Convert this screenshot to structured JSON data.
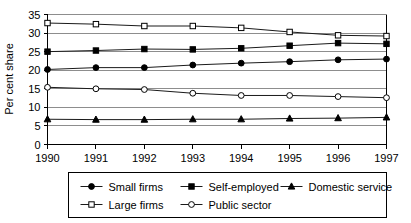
{
  "chart_data": {
    "type": "line",
    "title": "",
    "xlabel": "",
    "ylabel": "Per cent share",
    "categories": [
      "1990",
      "1991",
      "1992",
      "1993",
      "1994",
      "1995",
      "1996",
      "1997"
    ],
    "x": [
      1990,
      1991,
      1992,
      1993,
      1994,
      1995,
      1996,
      1997
    ],
    "ylim": [
      0,
      35
    ],
    "yticks": [
      0,
      5,
      10,
      15,
      20,
      25,
      30,
      35
    ],
    "ytick_labels": [
      "0",
      "5",
      "10",
      "15",
      "20",
      "25",
      "30",
      "35"
    ],
    "grid": true,
    "grid_axis": "y",
    "legend_position": "bottom",
    "series": [
      {
        "name": "Small firms",
        "marker": "filled-circle",
        "values": [
          20.2,
          20.7,
          20.7,
          21.4,
          21.9,
          22.3,
          22.8,
          23.0
        ]
      },
      {
        "name": "Self-employed",
        "marker": "filled-square",
        "values": [
          25.0,
          25.3,
          25.7,
          25.6,
          25.9,
          26.6,
          27.3,
          27.1
        ]
      },
      {
        "name": "Domestic service",
        "marker": "filled-triangle",
        "values": [
          6.8,
          6.7,
          6.7,
          6.8,
          6.8,
          7.0,
          7.1,
          7.3
        ]
      },
      {
        "name": "Large firms",
        "marker": "open-square",
        "values": [
          32.7,
          32.4,
          31.9,
          31.9,
          31.4,
          30.3,
          29.4,
          29.2
        ]
      },
      {
        "name": "Public sector",
        "marker": "open-circle",
        "values": [
          15.4,
          15.0,
          14.8,
          13.8,
          13.2,
          13.2,
          12.9,
          12.6
        ]
      }
    ]
  },
  "legend": {
    "rows": [
      [
        "Small firms",
        "Self-employed",
        "Domestic service"
      ],
      [
        "Large firms",
        "Public sector"
      ]
    ]
  },
  "axes": {
    "y_axis_label": "Per cent share"
  }
}
